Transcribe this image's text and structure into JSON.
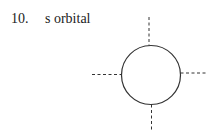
{
  "question": {
    "number": "10.",
    "title": "s orbital"
  },
  "diagram": {
    "shape": "circle",
    "axes": [
      "top",
      "right",
      "bottom",
      "left"
    ],
    "line_style": "dashed",
    "stroke_color": "#333333"
  }
}
